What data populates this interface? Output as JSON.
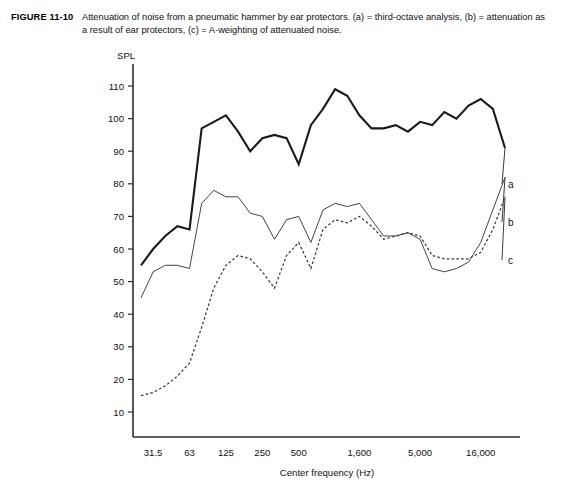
{
  "figure": {
    "number": "FIGURE 11-10",
    "caption": "Attenuation of noise from a pneumatic hammer by ear protectors. (a) = third-octave analysis, (b) = attenuation as a result of ear protectors, (c) = A-weighting of attenuated noise."
  },
  "chart_data": {
    "type": "line",
    "title": "",
    "xlabel": "Center frequency (Hz)",
    "ylabel": "SPL",
    "ylim": [
      0,
      115
    ],
    "yticks": [
      10,
      20,
      30,
      40,
      50,
      60,
      70,
      80,
      90,
      100,
      110
    ],
    "xticks_labeled": [
      "31.5",
      "63",
      "125",
      "250",
      "500",
      "1,600",
      "5,000",
      "16,000"
    ],
    "xtick_values": [
      31.5,
      63,
      125,
      250,
      500,
      1600,
      5000,
      16000
    ],
    "x_band_index": [
      0,
      1,
      2,
      3,
      4,
      5,
      6,
      7,
      8,
      9,
      10,
      11,
      12,
      13,
      14,
      15,
      16,
      17,
      18,
      19,
      20,
      21,
      22,
      23,
      24,
      25,
      26,
      27,
      28,
      29,
      30
    ],
    "x_center_frequencies": [
      25,
      31.5,
      40,
      50,
      63,
      80,
      100,
      125,
      160,
      200,
      250,
      315,
      400,
      500,
      630,
      800,
      1000,
      1250,
      1600,
      2000,
      2500,
      3150,
      4000,
      5000,
      6300,
      8000,
      10000,
      12500,
      16000,
      20000,
      25000
    ],
    "grid": false,
    "legend_position": "right-inline",
    "series": [
      {
        "name": "a",
        "label": "a",
        "description": "third-octave analysis",
        "style": "solid-thick",
        "values": [
          55,
          60,
          64,
          67,
          66,
          97,
          99,
          101,
          96,
          90,
          94,
          95,
          94,
          86,
          98,
          103,
          109,
          107,
          101,
          97,
          97,
          98,
          96,
          99,
          98,
          102,
          100,
          104,
          106,
          103,
          91
        ]
      },
      {
        "name": "b",
        "label": "b",
        "description": "attenuation as a result of ear protectors",
        "style": "solid-thin",
        "values": [
          45,
          53,
          55,
          55,
          54,
          74,
          78,
          76,
          76,
          71,
          70,
          63,
          69,
          70,
          62,
          72,
          74,
          73,
          74,
          69,
          64,
          64,
          65,
          63,
          54,
          53,
          54,
          56,
          62,
          72,
          82
        ]
      },
      {
        "name": "c",
        "label": "c",
        "description": "A-weighting of attenuated noise",
        "style": "dashed",
        "values": [
          15,
          16,
          18,
          21,
          25,
          36,
          48,
          55,
          58,
          57,
          53,
          48,
          58,
          62,
          54,
          66,
          69,
          68,
          70,
          67,
          63,
          64,
          65,
          64,
          58,
          57,
          57,
          57,
          59,
          66,
          76
        ]
      }
    ],
    "series_end_labels": [
      {
        "name": "a",
        "x": 508,
        "y": 146
      },
      {
        "name": "b",
        "x": 508,
        "y": 184
      },
      {
        "name": "c",
        "x": 508,
        "y": 222
      }
    ]
  }
}
